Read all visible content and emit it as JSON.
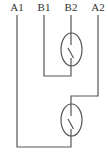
{
  "diagram": {
    "title": "",
    "terminals": [
      {
        "id": "A1",
        "label": "A1",
        "x": 17
      },
      {
        "id": "B1",
        "label": "B1",
        "x": 44
      },
      {
        "id": "B2",
        "label": "B2",
        "x": 71
      },
      {
        "id": "A2",
        "label": "A2",
        "x": 98
      }
    ],
    "components": [
      {
        "id": "switch-1",
        "type": "reed-switch",
        "connects": [
          "B1",
          "B2"
        ]
      },
      {
        "id": "switch-2",
        "type": "reed-switch",
        "connects": [
          "A1",
          "A2"
        ]
      }
    ],
    "colors": {
      "line": "#555555",
      "text": "#333333",
      "background": "#ffffff"
    }
  }
}
